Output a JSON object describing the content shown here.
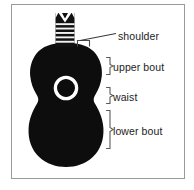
{
  "figure": {
    "frame": {
      "border_color": "#9a9a9a",
      "background": "#ffffff"
    },
    "colors": {
      "body": "#0d0d0d",
      "soundhole_ring": "#ffffff",
      "soundhole_center": "#0d0d0d",
      "fret_dark": "#111111",
      "fret_light": "#f2f2f2",
      "leader_line": "#3a3a3a",
      "bracket": "#5a5a5a",
      "text": "#1c1c1c"
    },
    "guitar": {
      "parts": [
        "headstock",
        "neck",
        "upper bout",
        "waist",
        "lower bout",
        "sound hole"
      ],
      "fret_count": 6
    },
    "labels": [
      {
        "id": "shoulder",
        "text": "shoulder",
        "annotation": "leader-line",
        "marker": "u-bracket"
      },
      {
        "id": "upper-bout",
        "text": "upper bout",
        "annotation": "curly-bracket",
        "marker": "right-bracket"
      },
      {
        "id": "waist",
        "text": "waist",
        "annotation": "curly-bracket",
        "marker": "right-bracket"
      },
      {
        "id": "lower-bout",
        "text": "lower bout",
        "annotation": "curly-bracket",
        "marker": "right-bracket"
      }
    ]
  }
}
